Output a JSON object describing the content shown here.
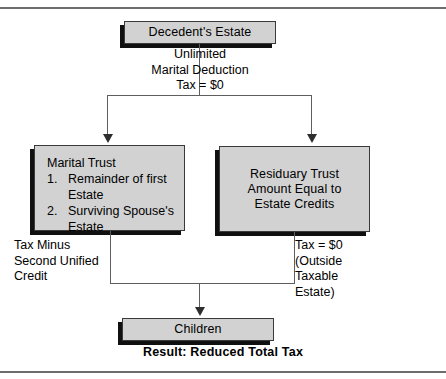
{
  "diagram": {
    "nodes": {
      "decedent": {
        "label": "Decedent's Estate"
      },
      "marital": {
        "title": "Marital Trust",
        "items": [
          {
            "num": "1.",
            "text": "Remainder of first Estate"
          },
          {
            "num": "2.",
            "text": "Surviving Spouse's Estate"
          }
        ]
      },
      "residuary": {
        "label": "Residuary Trust\nAmount Equal to\nEstate Credits"
      },
      "children": {
        "label": "Children"
      }
    },
    "annotations": {
      "deduction": "Unlimited\nMarital Deduction\nTax = $0",
      "tax_minus": "Tax Minus\nSecond Unified\nCredit",
      "tax_zero": "Tax = $0\n(Outside\nTaxable\nEstate)",
      "result": "Result: Reduced Total Tax"
    },
    "colors": {
      "node_fill": "#d2d2d2",
      "node_outline": "#3a3a3a",
      "node_shadow": "#101010",
      "connector": "#5e5e5e",
      "rule": "#6d6d6d",
      "text": "#000000"
    }
  }
}
